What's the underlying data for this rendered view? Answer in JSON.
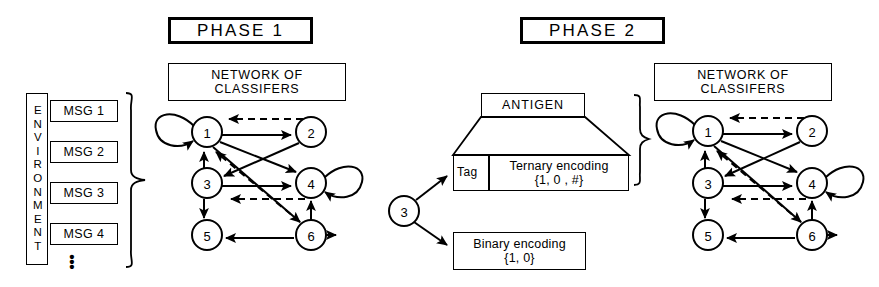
{
  "diagram": {
    "stroke_color": "#000000",
    "background_color": "#ffffff"
  },
  "phase1": {
    "title": "PHASE  1",
    "network_title_line1": "NETWORK OF",
    "network_title_line2": "CLASSIFERS",
    "environment_label": "ENVIRONMENT",
    "messages": [
      {
        "label": "MSG 1"
      },
      {
        "label": "MSG 2"
      },
      {
        "label": "MSG 3"
      },
      {
        "label": "MSG 4"
      }
    ],
    "ellipsis": "•",
    "network": {
      "nodes": [
        {
          "id": "1",
          "label": "1",
          "cx": 207,
          "cy": 132,
          "r": 15
        },
        {
          "id": "2",
          "label": "2",
          "cx": 311,
          "cy": 132,
          "r": 15
        },
        {
          "id": "3",
          "label": "3",
          "cx": 207,
          "cy": 183,
          "r": 15
        },
        {
          "id": "4",
          "label": "4",
          "cx": 311,
          "cy": 183,
          "r": 15
        },
        {
          "id": "5",
          "label": "5",
          "cx": 207,
          "cy": 235,
          "r": 15
        },
        {
          "id": "6",
          "label": "6",
          "cx": 311,
          "cy": 235,
          "r": 15
        }
      ],
      "edges": [
        {
          "from": "1",
          "to": "2",
          "style": "solid"
        },
        {
          "from": "2",
          "to": "1",
          "style": "dashed"
        },
        {
          "from": "3",
          "to": "1",
          "style": "solid"
        },
        {
          "from": "6",
          "to": "1",
          "style": "dashed"
        },
        {
          "from": "3",
          "to": "4",
          "style": "solid"
        },
        {
          "from": "4",
          "to": "3",
          "style": "dashed"
        },
        {
          "from": "1",
          "to": "4",
          "style": "solid"
        },
        {
          "from": "2",
          "to": "3",
          "style": "solid"
        },
        {
          "from": "1",
          "to": "6",
          "style": "solid"
        },
        {
          "from": "3",
          "to": "5",
          "style": "solid"
        },
        {
          "from": "6",
          "to": "5",
          "style": "solid"
        },
        {
          "from": "6",
          "to": "4",
          "style": "solid"
        }
      ],
      "self_loops": [
        {
          "node": "1",
          "side": "left"
        },
        {
          "node": "4",
          "side": "right"
        }
      ],
      "outputs": [
        {
          "node": "6",
          "direction": "right"
        }
      ]
    }
  },
  "phase2": {
    "title": "PHASE  2",
    "network_title_line1": "NETWORK OF",
    "network_title_line2": "CLASSIFERS",
    "antigen_label": "ANTIGEN",
    "tag_label": "Tag",
    "ternary_line1": "Ternary encoding",
    "ternary_line2": "{1, 0 , #}",
    "binary_line1": "Binary encoding",
    "binary_line2": "{1, 0}",
    "source_node_label": "3",
    "network": {
      "nodes": [
        {
          "id": "1",
          "label": "1",
          "cx": 708,
          "cy": 131,
          "r": 15
        },
        {
          "id": "2",
          "label": "2",
          "cx": 812,
          "cy": 131,
          "r": 15
        },
        {
          "id": "3",
          "label": "3",
          "cx": 708,
          "cy": 183,
          "r": 15
        },
        {
          "id": "4",
          "label": "4",
          "cx": 812,
          "cy": 183,
          "r": 15
        },
        {
          "id": "5",
          "label": "5",
          "cx": 708,
          "cy": 235,
          "r": 15
        },
        {
          "id": "6",
          "label": "6",
          "cx": 812,
          "cy": 235,
          "r": 15
        }
      ],
      "edges": [
        {
          "from": "1",
          "to": "2",
          "style": "solid"
        },
        {
          "from": "2",
          "to": "1",
          "style": "dashed"
        },
        {
          "from": "3",
          "to": "1",
          "style": "solid"
        },
        {
          "from": "6",
          "to": "1",
          "style": "dashed"
        },
        {
          "from": "3",
          "to": "4",
          "style": "solid"
        },
        {
          "from": "4",
          "to": "3",
          "style": "dashed"
        },
        {
          "from": "1",
          "to": "4",
          "style": "solid"
        },
        {
          "from": "2",
          "to": "3",
          "style": "solid"
        },
        {
          "from": "1",
          "to": "6",
          "style": "solid"
        },
        {
          "from": "3",
          "to": "5",
          "style": "solid"
        },
        {
          "from": "6",
          "to": "5",
          "style": "solid"
        },
        {
          "from": "6",
          "to": "4",
          "style": "solid"
        }
      ],
      "self_loops": [
        {
          "node": "1",
          "side": "left"
        },
        {
          "node": "4",
          "side": "right"
        }
      ],
      "outputs": [
        {
          "node": "6",
          "direction": "right"
        }
      ]
    }
  }
}
